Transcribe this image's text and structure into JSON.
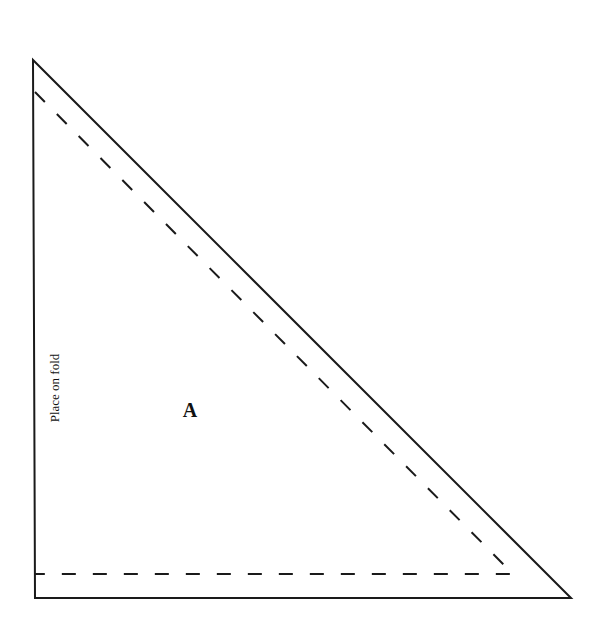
{
  "diagram": {
    "type": "sewing-pattern-piece",
    "piece_label": "A",
    "fold_label": "Place on fold",
    "colors": {
      "line": "#1a1a1a",
      "background": "#ffffff"
    },
    "cut_line": {
      "style": "solid",
      "points": [
        [
          33,
          60
        ],
        [
          35,
          598
        ],
        [
          571,
          598
        ]
      ]
    },
    "seam_line": {
      "style": "dashed",
      "points": [
        [
          35,
          92
        ],
        [
          513,
          574
        ],
        [
          35,
          574
        ]
      ]
    }
  }
}
